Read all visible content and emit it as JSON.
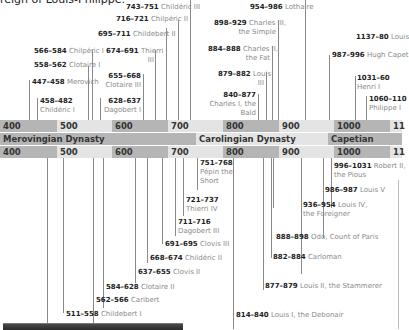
{
  "intro_text": "reign of Louis-Philippe.",
  "timeline": {
    "centuries": [
      "400",
      "500",
      "600",
      "700",
      "800",
      "900",
      "1000",
      "11"
    ],
    "dynasties": [
      {
        "name": "Merovingian Dynasty",
        "color": "#b5b5b5"
      },
      {
        "name": "Carolingian Dynasty",
        "color": "#e4e4e4"
      },
      {
        "name": "Capetian Dynasty",
        "color": "#b5b5b5"
      }
    ]
  },
  "kings_above": [
    {
      "years": "743–751",
      "name": "Childéric III"
    },
    {
      "years": "716–721",
      "name": "Chilpéric II"
    },
    {
      "years": "695–711",
      "name": "Childebert II"
    },
    {
      "years": "566–584",
      "name": "Chilpéric I"
    },
    {
      "years": "674–691",
      "name": "Thierri",
      "name2": "III"
    },
    {
      "years": "558–562",
      "name": "Clotaire I"
    },
    {
      "years": "655–668",
      "name": "Clotaire III"
    },
    {
      "years": "447–458",
      "name": "Merovich"
    },
    {
      "years": "458–482",
      "name": "Childéric I"
    },
    {
      "years": "628–637",
      "name": "Dagobert I"
    },
    {
      "years": "954–986",
      "name": "Lothaire"
    },
    {
      "years": "898–929",
      "name": "Charles III,",
      "name2": "the Simple"
    },
    {
      "years": "884–888",
      "name": "Charles II,",
      "name2": "the Fat"
    },
    {
      "years": "879–882",
      "name": "Louis",
      "name2": "III"
    },
    {
      "years": "840–877",
      "name": "Charles I, the",
      "name2": "Bald"
    },
    {
      "years": "1137–80",
      "name": "Louis"
    },
    {
      "years": "987–996",
      "name": "Hugh Capet"
    },
    {
      "years": "1031–60",
      "name": "Henri I"
    },
    {
      "years": "1060–110",
      "name": "Philippe I"
    }
  ],
  "kings_below": [
    {
      "years": "751–768",
      "name": "Pépin the",
      "name2": "Short"
    },
    {
      "years": "721–737",
      "name": "Thierri IV"
    },
    {
      "years": "711–716",
      "name": "Dagobert III"
    },
    {
      "years": "691–695",
      "name": "Clovis III"
    },
    {
      "years": "668–674",
      "name": "Childéric II"
    },
    {
      "years": "637–655",
      "name": "Clovis II"
    },
    {
      "years": "584–628",
      "name": "Clotaire II"
    },
    {
      "years": "562–566",
      "name": "Caribert"
    },
    {
      "years": "511–558",
      "name": "Childebert I"
    },
    {
      "years": "996–1031",
      "name": "Robert II,",
      "name2": "the Pious"
    },
    {
      "years": "986–987",
      "name": "Louis V"
    },
    {
      "years": "936–954",
      "name": "Louis IV,",
      "name2": "the Foreigner"
    },
    {
      "years": "888–898",
      "name": "Odo, Count of Paris"
    },
    {
      "years": "882–884",
      "name": "Carloman"
    },
    {
      "years": "877–879",
      "name": "Louis II, the Stammerer"
    },
    {
      "years": "814–840",
      "name": "Louis I, the Debonair"
    }
  ]
}
